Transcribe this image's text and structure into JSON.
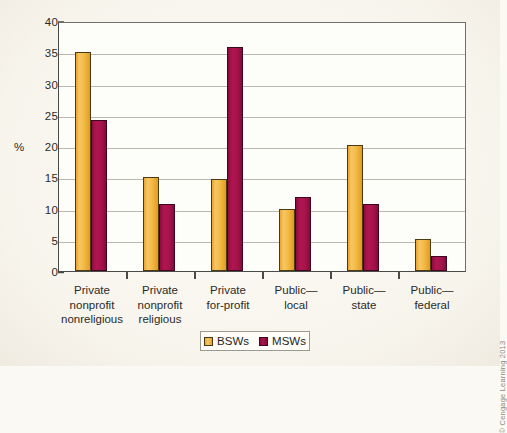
{
  "chart_data": {
    "type": "bar",
    "title": "",
    "xlabel": "",
    "ylabel": "%",
    "ylim": [
      0,
      40
    ],
    "yticks": [
      0,
      5,
      10,
      15,
      20,
      25,
      30,
      35,
      40
    ],
    "grid": true,
    "legend_position": "bottom",
    "categories": [
      "Private nonprofit nonreligious",
      "Private nonprofit religious",
      "Private for-profit",
      "Public—local",
      "Public—state",
      "Public—federal"
    ],
    "category_lines": [
      [
        "Private",
        "nonprofit",
        "nonreligious"
      ],
      [
        "Private",
        "nonprofit",
        "religious"
      ],
      [
        "Private",
        "for-profit"
      ],
      [
        "Public—",
        "local"
      ],
      [
        "Public—",
        "state"
      ],
      [
        "Public—",
        "federal"
      ]
    ],
    "series": [
      {
        "name": "BSWs",
        "color": "#F2B740",
        "values": [
          35.0,
          15.1,
          14.8,
          10.0,
          20.2,
          5.1
        ]
      },
      {
        "name": "MSWs",
        "color": "#A3144A",
        "values": [
          24.1,
          10.7,
          35.8,
          11.9,
          10.7,
          2.4
        ]
      }
    ]
  },
  "axis": {
    "y_label": "%",
    "y_tick_labels": [
      "0",
      "5",
      "10",
      "15",
      "20",
      "25",
      "30",
      "35",
      "40"
    ]
  },
  "legend": {
    "items": [
      {
        "label": "BSWs",
        "swatch": "bsw-swatch"
      },
      {
        "label": "MSWs",
        "swatch": "msw-swatch"
      }
    ]
  },
  "credit": {
    "text": "© Cengage Learning 2013"
  }
}
